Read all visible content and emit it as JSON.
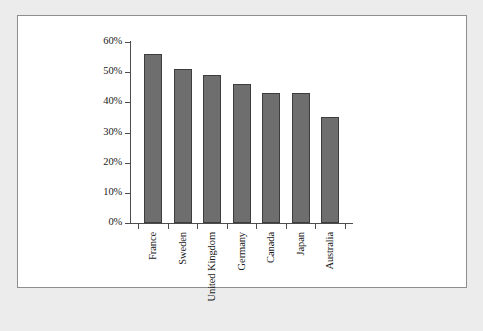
{
  "chart_data": {
    "type": "bar",
    "title": "",
    "xlabel": "",
    "ylabel": "",
    "categories": [
      "France",
      "Sweden",
      "United Kingdom",
      "Germany",
      "Canada",
      "Japan",
      "Australia"
    ],
    "values": [
      56,
      51,
      49,
      46,
      43,
      43,
      35
    ],
    "ylim": [
      0,
      60
    ],
    "ytick_values": [
      0,
      10,
      20,
      30,
      40,
      50,
      60
    ],
    "ytick_labels": [
      "0%",
      "10%",
      "20%",
      "30%",
      "40%",
      "50%",
      "60%"
    ],
    "grid": false,
    "legend": null,
    "value_suffix": "%",
    "bar_color": "#6e6e6e",
    "bar_border_color": "#3d3d3d",
    "axis_color": "#4d4d4d",
    "plot_background": "#ffffff",
    "page_background": "#ececed",
    "frame_border_color": "#8e8e8e"
  }
}
